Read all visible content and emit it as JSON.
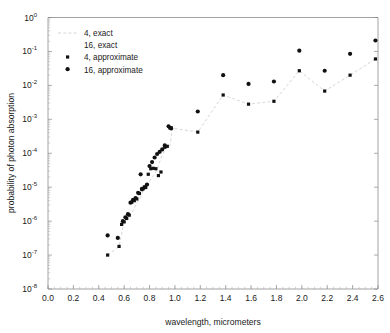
{
  "chart_data": {
    "type": "scatter",
    "title": "",
    "xlabel": "wavelength, micrometers",
    "ylabel": "probability of photon absorption",
    "xlim": [
      0.0,
      2.6
    ],
    "ylim": [
      1e-08,
      1.0
    ],
    "yscale": "log",
    "xscale": "linear",
    "grid": false,
    "legend_position": "upper-left",
    "xticks": [
      "0.0",
      "0.2",
      "0.4",
      "0.6",
      "0.8",
      "1.0",
      "1.2",
      "1.4",
      "1.6",
      "1.8",
      "2.0",
      "2.2",
      "2.4",
      "2.6"
    ],
    "xtick_values": [
      0.0,
      0.2,
      0.4,
      0.6,
      0.8,
      1.0,
      1.2,
      1.4,
      1.6,
      1.8,
      2.0,
      2.2,
      2.4,
      2.6
    ],
    "ytick_exponents": [
      0,
      -1,
      -2,
      -3,
      -4,
      -5,
      -6,
      -7,
      -8
    ],
    "ytick_mantissa": "10",
    "series": [
      {
        "name": "4, exact",
        "marker": "dashed-line",
        "color": "#d2d2d2",
        "x": [
          0.47,
          0.56,
          0.6,
          0.62,
          0.65,
          0.68,
          0.7,
          0.73,
          0.75,
          0.78,
          0.8,
          0.83,
          0.86,
          0.88,
          0.9,
          0.93,
          0.96,
          0.98,
          1.18,
          1.38,
          1.58,
          1.78,
          1.98,
          2.18,
          2.38,
          2.58
        ],
        "y": [
          1e-07,
          1.8e-07,
          9.5e-07,
          1.2e-06,
          1.5e-06,
          2.4e-06,
          3.5e-06,
          5e-06,
          8.5e-06,
          9.5e-06,
          1.5e-05,
          2.2e-05,
          3.2e-05,
          5.5e-05,
          9e-05,
          0.00014,
          0.00016,
          0.00055,
          0.00042,
          0.0052,
          0.0028,
          0.0034,
          0.027,
          0.0068,
          0.02,
          0.06
        ]
      },
      {
        "name": "16, exact",
        "marker": "none",
        "color": "#d2d2d2",
        "x": [],
        "y": []
      },
      {
        "name": "4, approximate",
        "marker": "square",
        "color": "#111111",
        "x": [
          0.47,
          0.56,
          0.58,
          0.6,
          0.62,
          0.64,
          0.66,
          0.68,
          0.7,
          0.72,
          0.74,
          0.75,
          0.77,
          0.79,
          0.81,
          0.83,
          0.85,
          0.87,
          0.89,
          0.92,
          0.94,
          0.96,
          0.97,
          1.18,
          1.38,
          1.58,
          1.78,
          1.98,
          2.18,
          2.38,
          2.58
        ],
        "y": [
          1e-07,
          1.8e-07,
          8e-07,
          9.5e-07,
          1.2e-06,
          1.5e-06,
          3.6e-06,
          4e-06,
          4.5e-06,
          6.5e-06,
          8.5e-06,
          9e-06,
          9.8e-06,
          2.4e-05,
          3.5e-05,
          3.6e-05,
          3.5e-05,
          2.2e-05,
          2.8e-05,
          0.00015,
          0.00016,
          0.00056,
          0.00056,
          0.00042,
          0.0052,
          0.0028,
          0.0034,
          0.027,
          0.0068,
          0.02,
          0.06
        ]
      },
      {
        "name": "16, approximate",
        "marker": "circle",
        "color": "#111111",
        "x": [
          0.47,
          0.55,
          0.59,
          0.61,
          0.63,
          0.65,
          0.67,
          0.69,
          0.71,
          0.73,
          0.74,
          0.76,
          0.78,
          0.8,
          0.82,
          0.84,
          0.86,
          0.88,
          0.9,
          0.92,
          0.95,
          0.97,
          1.18,
          1.38,
          1.58,
          1.78,
          1.98,
          2.18,
          2.38,
          2.58
        ],
        "y": [
          3.8e-07,
          3.2e-07,
          1e-06,
          1.3e-06,
          1.6e-06,
          3.5e-06,
          4.2e-06,
          4.8e-06,
          6.8e-06,
          2.4e-05,
          9e-06,
          1e-05,
          1.2e-05,
          4.2e-05,
          5.5e-05,
          7.5e-05,
          9.5e-05,
          0.00011,
          0.00013,
          0.00017,
          0.00062,
          0.00054,
          0.0017,
          0.02,
          0.011,
          0.013,
          0.105,
          0.027,
          0.085,
          0.21
        ]
      }
    ]
  },
  "legend": {
    "entries": [
      {
        "label": "4, exact",
        "marker": "dashed-line"
      },
      {
        "label": "16, exact",
        "marker": "none"
      },
      {
        "label": "4, approximate",
        "marker": "square"
      },
      {
        "label": "16, approximate",
        "marker": "circle"
      }
    ]
  },
  "axes": {
    "x_title": "wavelength, micrometers",
    "y_title": "probability of photon absorption"
  }
}
